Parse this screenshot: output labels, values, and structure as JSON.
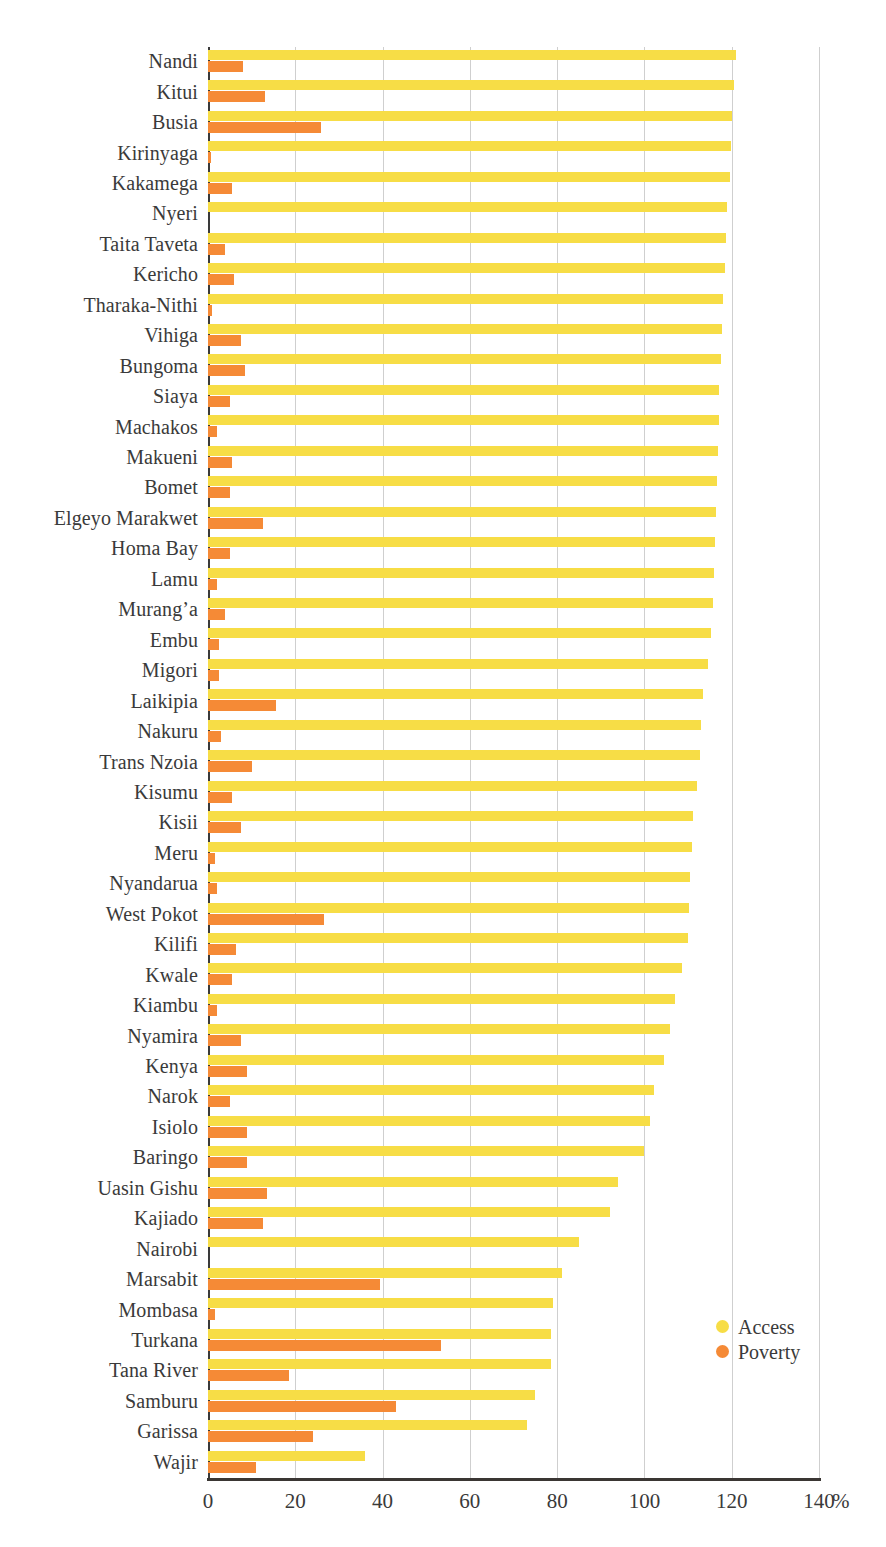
{
  "chart_data": {
    "type": "bar",
    "orientation": "horizontal",
    "title": "",
    "subtitle": "",
    "xlabel": "%",
    "ylabel": "",
    "xlim": [
      0,
      140
    ],
    "xticks": [
      0,
      20,
      40,
      60,
      80,
      100,
      120,
      140
    ],
    "xtick_labels": [
      "0",
      "20",
      "40",
      "60",
      "80",
      "100",
      "120",
      "140"
    ],
    "unit_label": "%",
    "grid": "vertical",
    "legend_position": "bottom-right",
    "colors": {
      "access": "#f7dd46",
      "poverty": "#f58a36",
      "axis": "#3a3633",
      "gridline": "#cfcfcf",
      "text": "#3a3a3a"
    },
    "categories": [
      "Nandi",
      "Kitui",
      "Busia",
      "Kirinyaga",
      "Kakamega",
      "Nyeri",
      "Taita Taveta",
      "Kericho",
      "Tharaka-Nithi",
      "Vihiga",
      "Bungoma",
      "Siaya",
      "Machakos",
      "Makueni",
      "Bomet",
      "Elgeyo Marakwet",
      "Homa Bay",
      "Lamu",
      "Murang’a",
      "Embu",
      "Migori",
      "Laikipia",
      "Nakuru",
      "Trans Nzoia",
      "Kisumu",
      "Kisii",
      "Meru",
      "Nyandarua",
      "West Pokot",
      "Kilifi",
      "Kwale",
      "Kiambu",
      "Nyamira",
      "Kenya",
      "Narok",
      "Isiolo",
      "Baringo",
      "Uasin Gishu",
      "Kajiado",
      "Nairobi",
      "Marsabit",
      "Mombasa",
      "Turkana",
      "Tana River",
      "Samburu",
      "Garissa",
      "Wajir"
    ],
    "series": [
      {
        "name": "Access",
        "color": "#f7dd46",
        "values": [
          121.0,
          120.5,
          120.0,
          119.8,
          119.5,
          119.0,
          118.8,
          118.5,
          118.0,
          117.8,
          117.5,
          117.2,
          117.0,
          116.8,
          116.6,
          116.5,
          116.2,
          116.0,
          115.8,
          115.2,
          114.5,
          113.5,
          113.0,
          112.8,
          112.0,
          111.2,
          111.0,
          110.5,
          110.2,
          110.0,
          108.5,
          107.0,
          105.8,
          104.5,
          102.2,
          101.2,
          100.0,
          94.0,
          92.0,
          85.0,
          81.0,
          79.0,
          78.5,
          78.5,
          75.0,
          73.0,
          36.0
        ]
      },
      {
        "name": "Poverty",
        "color": "#f58a36",
        "values": [
          8.0,
          13.0,
          26.0,
          0.8,
          5.5,
          0.0,
          4.0,
          6.0,
          1.0,
          7.5,
          8.5,
          5.0,
          2.0,
          5.5,
          5.0,
          12.5,
          5.0,
          2.0,
          4.0,
          2.5,
          2.5,
          15.5,
          3.0,
          10.0,
          5.5,
          7.5,
          1.5,
          2.0,
          26.5,
          6.5,
          5.5,
          2.0,
          7.5,
          9.0,
          5.0,
          9.0,
          9.0,
          13.5,
          12.5,
          0.0,
          39.5,
          1.5,
          53.5,
          18.5,
          43.0,
          24.0,
          11.0
        ]
      }
    ],
    "legend": [
      {
        "label": "Access",
        "color": "#f7dd46"
      },
      {
        "label": "Poverty",
        "color": "#f58a36"
      }
    ]
  }
}
